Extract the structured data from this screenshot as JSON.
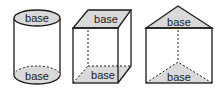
{
  "figure": {
    "shapes": [
      {
        "name": "cylinder",
        "top_label": "base",
        "bottom_label": "base"
      },
      {
        "name": "rectangular-prism",
        "top_label": "base",
        "bottom_label": "base"
      },
      {
        "name": "triangular-prism",
        "top_label": "base",
        "bottom_label": "base"
      }
    ],
    "colors": {
      "base_fill": "#d9d9d9",
      "stroke": "#1a1a1a",
      "background": "#ffffff"
    }
  }
}
